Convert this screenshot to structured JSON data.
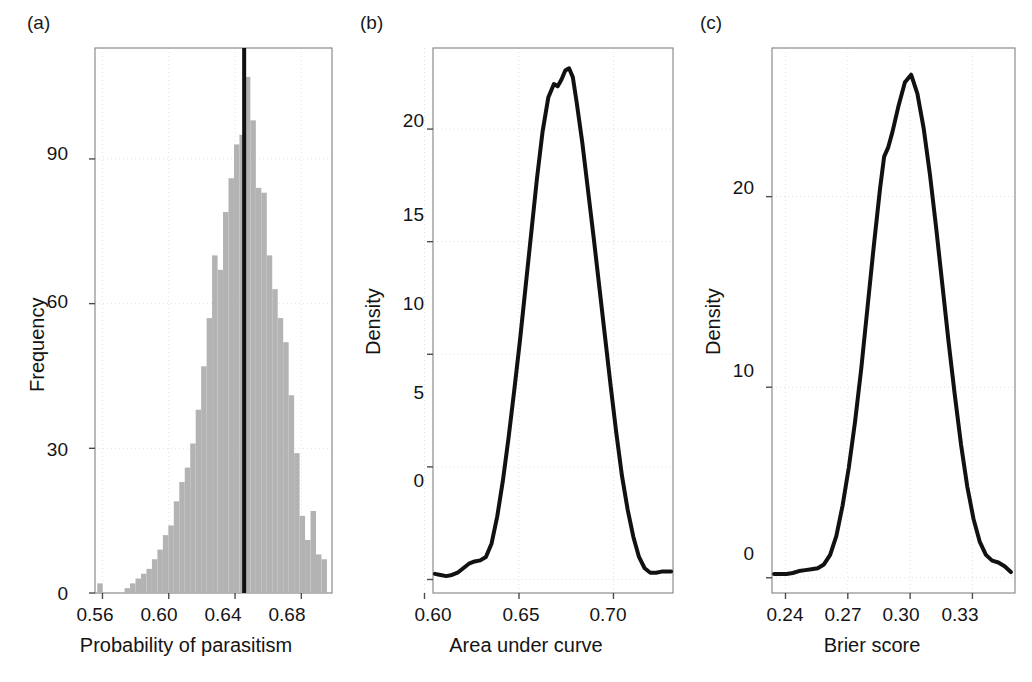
{
  "figure": {
    "background": "#ffffff",
    "bar_color": "#b3b3b3",
    "line_color": "#111111",
    "grid_color": "#e3e3e3",
    "frame_color": "#8c8c8c"
  },
  "panels": [
    {
      "id": "a",
      "letter": "(a)",
      "xlabel": "Probability of parasitism",
      "ylabel": "Frequency",
      "xticks": [
        "0.56",
        "0.60",
        "0.64",
        "0.68"
      ],
      "yticks": [
        "0",
        "30",
        "60",
        "90"
      ],
      "annotation": ""
    },
    {
      "id": "b",
      "letter": "(b)",
      "xlabel": "Area under curve",
      "ylabel": "Density",
      "xticks": [
        "0.60",
        "0.65",
        "0.70"
      ],
      "yticks": [
        "0",
        "5",
        "10",
        "15",
        "20"
      ],
      "annotation": "avg AUC = 0.67"
    },
    {
      "id": "c",
      "letter": "(c)",
      "xlabel": "Brier score",
      "ylabel": "Density",
      "xticks": [
        "0.24",
        "0.27",
        "0.30",
        "0.33"
      ],
      "yticks": [
        "0",
        "10",
        "20"
      ],
      "annotation": "avg Brier score = 0.3"
    }
  ],
  "chart_data": [
    {
      "type": "bar",
      "panel": "a",
      "title": "",
      "xlabel": "Probability of parasitism",
      "ylabel": "Frequency",
      "xlim": [
        0.5555,
        0.6985
      ],
      "ylim": [
        0,
        113
      ],
      "xticks": [
        0.56,
        0.6,
        0.64,
        0.68
      ],
      "yticks": [
        0,
        30,
        60,
        90
      ],
      "grid": true,
      "bin_width": 0.0033,
      "bin_centers": [
        0.5585,
        0.5618,
        0.5651,
        0.5684,
        0.5717,
        0.575,
        0.5783,
        0.5816,
        0.5849,
        0.5882,
        0.5915,
        0.5948,
        0.5981,
        0.6014,
        0.6047,
        0.608,
        0.6113,
        0.6146,
        0.6179,
        0.6212,
        0.6245,
        0.6278,
        0.6311,
        0.6344,
        0.6377,
        0.641,
        0.6443,
        0.6476,
        0.6509,
        0.6542,
        0.6575,
        0.6608,
        0.6641,
        0.6674,
        0.6707,
        0.674,
        0.6773,
        0.6806,
        0.6839,
        0.6872,
        0.6905,
        0.6938
      ],
      "values": [
        2,
        0,
        0,
        0,
        0,
        1,
        2,
        3,
        4,
        5,
        7,
        9,
        12,
        14,
        19,
        23,
        26,
        31,
        38,
        47,
        57,
        70,
        67,
        79,
        86,
        93,
        95,
        107,
        98,
        84,
        83,
        70,
        63,
        57,
        52,
        41,
        29,
        16,
        11,
        17,
        8,
        7
      ],
      "vline": {
        "x": 0.6455,
        "color": "#111111",
        "label": "mean probability of parasitism"
      }
    },
    {
      "type": "line",
      "panel": "b",
      "title": "",
      "xlabel": "Area under curve",
      "ylabel": "Density",
      "xlim": [
        0.6045,
        0.7315
      ],
      "ylim": [
        -0.6,
        23.6
      ],
      "xticks": [
        0.6,
        0.65,
        0.7
      ],
      "yticks": [
        0,
        5,
        10,
        15,
        20
      ],
      "grid": true,
      "annotation": "avg AUC = 0.67",
      "x": [
        0.6055,
        0.6085,
        0.6115,
        0.6145,
        0.6175,
        0.6205,
        0.6235,
        0.6265,
        0.6295,
        0.6325,
        0.6355,
        0.6385,
        0.6415,
        0.6445,
        0.6475,
        0.6505,
        0.6535,
        0.6565,
        0.6595,
        0.6625,
        0.6655,
        0.6685,
        0.6705,
        0.6725,
        0.6745,
        0.6765,
        0.6785,
        0.6805,
        0.6835,
        0.6865,
        0.6895,
        0.6925,
        0.6955,
        0.6985,
        0.7015,
        0.7045,
        0.7075,
        0.7105,
        0.7135,
        0.7165,
        0.7195,
        0.7225,
        0.7255,
        0.7285,
        0.7305
      ],
      "y": [
        0.25,
        0.2,
        0.15,
        0.2,
        0.3,
        0.5,
        0.7,
        0.8,
        0.85,
        1.0,
        1.6,
        2.8,
        4.4,
        6.3,
        8.4,
        10.6,
        13.0,
        15.4,
        17.8,
        19.9,
        21.4,
        22.0,
        21.9,
        22.2,
        22.6,
        22.7,
        22.3,
        21.2,
        19.4,
        17.3,
        15.2,
        13.0,
        10.8,
        8.6,
        6.5,
        4.6,
        3.1,
        1.9,
        1.0,
        0.5,
        0.3,
        0.3,
        0.35,
        0.35,
        0.35
      ]
    },
    {
      "type": "line",
      "panel": "c",
      "title": "",
      "xlabel": "Brier score",
      "ylabel": "Density",
      "xlim": [
        0.2335,
        0.3505
      ],
      "ylim": [
        -0.8,
        27.8
      ],
      "xticks": [
        0.24,
        0.27,
        0.3,
        0.33
      ],
      "yticks": [
        0,
        10,
        20
      ],
      "grid": true,
      "annotation": "avg Brier score = 0.3",
      "x": [
        0.2345,
        0.2375,
        0.2405,
        0.2435,
        0.2465,
        0.2495,
        0.2525,
        0.2555,
        0.2585,
        0.2615,
        0.2645,
        0.2675,
        0.2705,
        0.2735,
        0.2765,
        0.2795,
        0.2825,
        0.2855,
        0.2875,
        0.2895,
        0.2915,
        0.2945,
        0.2975,
        0.3005,
        0.3035,
        0.3065,
        0.3095,
        0.3125,
        0.3155,
        0.3185,
        0.3215,
        0.3245,
        0.3275,
        0.3305,
        0.3335,
        0.3365,
        0.3395,
        0.3425,
        0.3455,
        0.3485
      ],
      "y": [
        0.2,
        0.2,
        0.2,
        0.25,
        0.35,
        0.4,
        0.45,
        0.5,
        0.7,
        1.2,
        2.2,
        3.8,
        5.8,
        8.2,
        11.0,
        14.2,
        17.4,
        20.4,
        22.1,
        22.6,
        23.4,
        24.8,
        26.0,
        26.4,
        25.4,
        23.6,
        21.2,
        18.4,
        15.4,
        12.4,
        9.6,
        7.0,
        4.8,
        3.1,
        1.9,
        1.2,
        0.9,
        0.8,
        0.6,
        0.3
      ]
    }
  ]
}
